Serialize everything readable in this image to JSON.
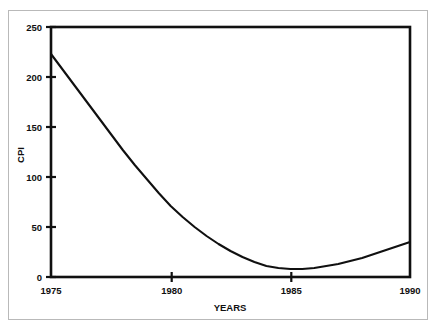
{
  "chart_data": {
    "type": "line",
    "title": "",
    "xlabel": "YEARS",
    "ylabel": "CPI",
    "xlim": [
      1975,
      1990
    ],
    "ylim": [
      0,
      250
    ],
    "grid": false,
    "legend": null,
    "x_ticks": [
      {
        "value": 1975,
        "label": "1975"
      },
      {
        "value": 1980,
        "label": "1980"
      },
      {
        "value": 1985,
        "label": "1985"
      },
      {
        "value": 1990,
        "label": "1990"
      }
    ],
    "y_ticks": [
      {
        "value": 0,
        "label": "0"
      },
      {
        "value": 50,
        "label": "50"
      },
      {
        "value": 100,
        "label": "100"
      },
      {
        "value": 150,
        "label": "150"
      },
      {
        "value": 200,
        "label": "200"
      },
      {
        "value": 250,
        "label": "250"
      }
    ],
    "series": [
      {
        "name": "CPI",
        "color": "#101010",
        "x": [
          1975,
          1975.5,
          1976,
          1976.5,
          1977,
          1977.5,
          1978,
          1978.5,
          1979,
          1979.5,
          1980,
          1980.5,
          1981,
          1981.5,
          1982,
          1982.5,
          1983,
          1983.5,
          1984,
          1984.5,
          1985,
          1985.5,
          1986,
          1986.5,
          1987,
          1987.5,
          1988,
          1988.5,
          1989,
          1989.5,
          1990
        ],
        "values": [
          223,
          207,
          191,
          175,
          159,
          143,
          127,
          112,
          98,
          84,
          71,
          60,
          50,
          41,
          33,
          26,
          20,
          15,
          11,
          9,
          8,
          8,
          9,
          11,
          13,
          16,
          19,
          23,
          27,
          31,
          35
        ]
      }
    ]
  }
}
